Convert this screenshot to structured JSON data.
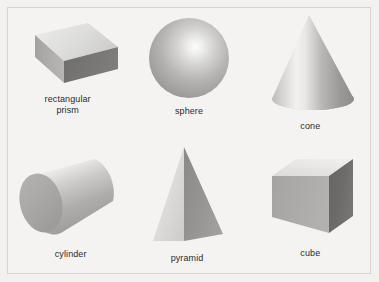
{
  "page": {
    "background_color": "#f2f1ef",
    "border_color": "#d6d4d1",
    "text_color": "#2b2b2b"
  },
  "palette": {
    "light_face": "#e3e2e0",
    "mid_face": "#a9a8a6",
    "dark_face": "#6f6e6d",
    "highlight": "#fbfbfa",
    "shadow": "#5f5e5d"
  },
  "figures": [
    {
      "id": "rectangular-prism",
      "label": "rectangular\nprism",
      "shape": "rectangular prism",
      "faces": [
        "top",
        "front",
        "right-end"
      ],
      "face_tones": [
        "light",
        "mid",
        "dark"
      ]
    },
    {
      "id": "sphere",
      "label": "sphere",
      "shape": "sphere",
      "faces": [
        "curved-surface"
      ],
      "face_tones": [
        "radial-highlight"
      ]
    },
    {
      "id": "cone",
      "label": "cone",
      "shape": "cone",
      "faces": [
        "lateral-surface",
        "base"
      ],
      "face_tones": [
        "vertical-highlight",
        "dark"
      ]
    },
    {
      "id": "cylinder",
      "label": "cylinder",
      "shape": "cylinder",
      "faces": [
        "lateral-surface",
        "left-cap"
      ],
      "face_tones": [
        "vertical-highlight",
        "mid"
      ]
    },
    {
      "id": "pyramid",
      "label": "pyramid",
      "shape": "pyramid",
      "faces": [
        "left-face",
        "right-face"
      ],
      "face_tones": [
        "light",
        "dark"
      ]
    },
    {
      "id": "cube",
      "label": "cube",
      "shape": "cube",
      "faces": [
        "top",
        "left",
        "front"
      ],
      "face_tones": [
        "light",
        "mid",
        "dark"
      ]
    }
  ]
}
